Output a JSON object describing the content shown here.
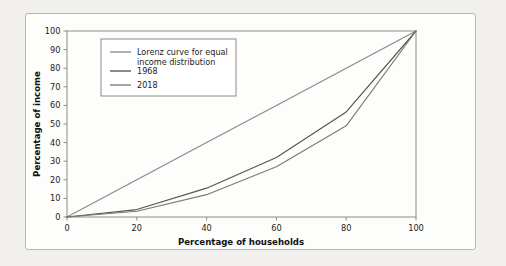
{
  "chart_data": {
    "type": "line",
    "title": "",
    "xlabel": "Percentage of households",
    "ylabel": "Percentage of income",
    "xlim": [
      0,
      100
    ],
    "ylim": [
      0,
      100
    ],
    "xticks": [
      "0",
      "20",
      "40",
      "60",
      "80",
      "100"
    ],
    "xtick_values": [
      0,
      20,
      40,
      60,
      80,
      100
    ],
    "yticks": [
      "0",
      "10",
      "20",
      "30",
      "40",
      "50",
      "60",
      "70",
      "80",
      "90",
      "100"
    ],
    "ytick_values": [
      0,
      10,
      20,
      30,
      40,
      50,
      60,
      70,
      80,
      90,
      100
    ],
    "grid": false,
    "legend_position": "upper-left-inside",
    "x": [
      0,
      20,
      40,
      60,
      80,
      100
    ],
    "series": [
      {
        "name": "Lorenz curve for equal income distribution",
        "legend_label_line1": "Lorenz curve for equal",
        "legend_label_line2": "income distribution",
        "color": "#8a8a8a",
        "values": [
          0,
          20,
          40,
          60,
          80,
          100
        ]
      },
      {
        "name": "1968",
        "legend_label_line1": "1968",
        "legend_label_line2": "",
        "color": "#55544f",
        "values": [
          0,
          4.0,
          15.5,
          32.0,
          56.5,
          100
        ]
      },
      {
        "name": "2018",
        "legend_label_line1": "2018",
        "legend_label_line2": "",
        "color": "#7b7a76",
        "values": [
          0,
          3.1,
          12.0,
          27.0,
          49.0,
          100
        ]
      }
    ]
  },
  "figure": {
    "panel_background": "#fdfdfc",
    "page_background": "#f1f0ee",
    "axis_color": "#8d8b88",
    "text_color": "#1b1b1b"
  }
}
